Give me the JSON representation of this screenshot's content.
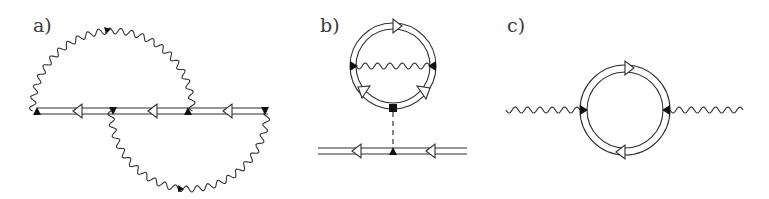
{
  "figure": {
    "panels": [
      {
        "label": "a)",
        "description": "Two-loop self-energy: double-line propagator with two crossing wavy boson lines",
        "elements": {
          "propagator": {
            "type": "double-line",
            "arrows": 3,
            "arrow_direction": "left"
          },
          "vertices": 4,
          "wavy_lines": [
            {
              "position": "upper-arc",
              "from_vertex": 1,
              "to_vertex": 3
            },
            {
              "position": "lower-arc",
              "from_vertex": 2,
              "to_vertex": 4
            }
          ]
        }
      },
      {
        "label": "b)",
        "description": "Tadpole-type diagram: dressed loop with internal wavy line connected via dashed line to a propagator",
        "elements": {
          "loop": {
            "type": "double-line-circle",
            "arrows": 3
          },
          "internal_wavy_line": {
            "orientation": "horizontal"
          },
          "dashed_line": {
            "orientation": "vertical"
          },
          "propagator": {
            "type": "double-line",
            "arrows": 2,
            "arrow_direction": "left"
          },
          "vertices": 4
        }
      },
      {
        "label": "c)",
        "description": "Polarization bubble: double-line loop with two external wavy lines",
        "elements": {
          "loop": {
            "type": "double-line-circle",
            "arrows": 2
          },
          "external_wavy_lines": 2,
          "vertices": 2
        }
      }
    ],
    "colors": {
      "line": "#2e2e2e",
      "vertex": "#111111",
      "background": "#ffffff"
    }
  }
}
